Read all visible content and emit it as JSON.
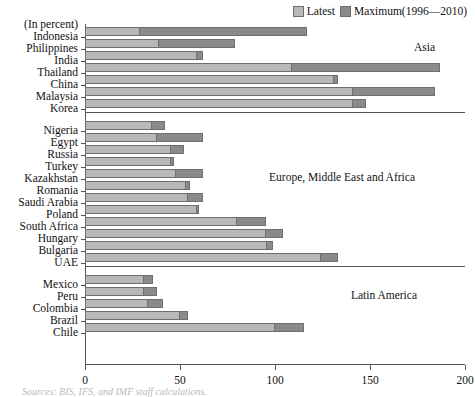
{
  "legend": {
    "latest_label": "Latest",
    "maximum_label": "Maximum(1996—2010)",
    "latest_color": "#b8b8b8",
    "maximum_color": "#8a8a8a"
  },
  "axis": {
    "unit_note": "(In percent)",
    "x_ticks": [
      "0",
      "50",
      "100",
      "150",
      "200"
    ],
    "x_min": 0,
    "x_max": 200
  },
  "regions": [
    {
      "name": "Asia"
    },
    {
      "name": "Europe, Middle East and Africa"
    },
    {
      "name": "Latin America"
    }
  ],
  "source_note": "Sources: BIS, IFS, and IMF staff calculations.",
  "top_caption": "",
  "chart_data": {
    "type": "bar",
    "orientation": "horizontal",
    "title": "",
    "xlabel": "(In percent)",
    "ylabel": "",
    "xlim": [
      0,
      200
    ],
    "grid": false,
    "legend_position": "top-right",
    "categories": [
      "Indonesia",
      "Philippines",
      "India",
      "Thailand",
      "China",
      "Malaysia",
      "Korea",
      "Nigeria",
      "Egypt",
      "Russia",
      "Turkey",
      "Kazakhstan",
      "Romania",
      "Saudi Arabia",
      "Poland",
      "South Africa",
      "Hungary",
      "Bulgaria",
      "UAE",
      "Mexico",
      "Peru",
      "Colombia",
      "Brazil",
      "Chile"
    ],
    "groups": [
      {
        "name": "Asia",
        "categories": [
          "Indonesia",
          "Philippines",
          "India",
          "Thailand",
          "China",
          "Malaysia",
          "Korea"
        ]
      },
      {
        "name": "Europe, Middle East and Africa",
        "categories": [
          "Nigeria",
          "Egypt",
          "Russia",
          "Turkey",
          "Kazakhstan",
          "Romania",
          "Saudi Arabia",
          "Poland",
          "South Africa",
          "Hungary",
          "Bulgaria",
          "UAE"
        ]
      },
      {
        "name": "Latin America",
        "categories": [
          "Mexico",
          "Peru",
          "Colombia",
          "Brazil",
          "Chile"
        ]
      }
    ],
    "series": [
      {
        "name": "Latest",
        "values": [
          29,
          39,
          59,
          109,
          131,
          141,
          141,
          35,
          38,
          45,
          45,
          48,
          53,
          54,
          59,
          80,
          95,
          96,
          124,
          31,
          31,
          33,
          50,
          100
        ]
      },
      {
        "name": "Maximum(1996—2010)",
        "values": [
          117,
          79,
          62,
          187,
          133,
          184,
          148,
          42,
          62,
          52,
          47,
          62,
          55,
          62,
          60,
          95,
          104,
          99,
          133,
          36,
          38,
          41,
          54,
          115
        ]
      }
    ]
  }
}
